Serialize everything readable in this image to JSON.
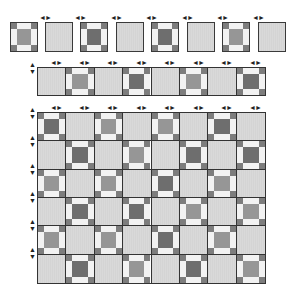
{
  "diagram": {
    "colors": {
      "border": "#333333",
      "plain_fill": "#d6d6d6",
      "corner_dark": "#7d7d7d",
      "edge_light": "#f2f2f2",
      "center_dark": "#6e6e6e",
      "center_medium": "#969696"
    },
    "top_row_blocks": [
      {
        "type": "nine-patch",
        "center": "medium"
      },
      {
        "type": "plain"
      },
      {
        "type": "nine-patch",
        "center": "dark"
      },
      {
        "type": "plain"
      },
      {
        "type": "nine-patch",
        "center": "dark"
      },
      {
        "type": "plain"
      },
      {
        "type": "nine-patch",
        "center": "medium"
      },
      {
        "type": "plain"
      }
    ],
    "strip": [
      "plain",
      "nine-patch",
      "plain",
      "nine-patch",
      "plain",
      "nine-patch",
      "plain",
      "nine-patch"
    ],
    "grid": {
      "columns": 8,
      "rows": 6,
      "pattern": "checkerboard, nine-patch in even positions of odd rows"
    },
    "arrow_glyph": "⇄",
    "vertical_arrow_glyph": "⇅",
    "caption": ""
  }
}
